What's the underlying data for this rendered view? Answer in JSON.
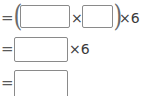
{
  "document": {
    "kind": "math-worksheet-fragment",
    "background_color": "#ffffff",
    "ink_color": "#3a3a3a",
    "box_border_color": "#8a8a8a"
  },
  "rows": [
    {
      "id": "row-1",
      "equals": "=",
      "open_paren": "(",
      "box_1_value": "",
      "operator": "×",
      "box_2_value": "",
      "close_paren": ")",
      "trailing": "×6"
    },
    {
      "id": "row-2",
      "equals": "=",
      "box_1_value": "",
      "trailing": "×6"
    },
    {
      "id": "row-3",
      "equals": "=",
      "box_1_value": ""
    }
  ]
}
